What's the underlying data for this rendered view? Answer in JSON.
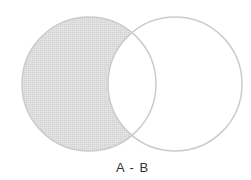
{
  "diagram": {
    "type": "venn",
    "operation_label": "A - B",
    "sets": [
      {
        "name": "A",
        "shaded": true
      },
      {
        "name": "B",
        "shaded": false
      }
    ],
    "colors": {
      "fill": "#dcdcdc",
      "stroke": "#c8c8c8",
      "background": "#ffffff"
    }
  }
}
